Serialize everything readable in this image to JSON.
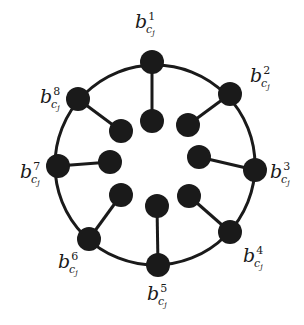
{
  "diagram": {
    "type": "wheel-graph",
    "ring": {
      "cx": 155,
      "cy": 165,
      "r": 100,
      "stroke": "#1a1a1a"
    },
    "node_color": "#1a1a1a",
    "outer_nodes": [
      {
        "id": "b1",
        "base": "b",
        "sup": "1",
        "sub": "cj",
        "x": 152,
        "y": 62,
        "inner": {
          "x": 152,
          "y": 121
        },
        "label": {
          "x": 135,
          "y": 28
        }
      },
      {
        "id": "b2",
        "base": "b",
        "sup": "2",
        "sub": "cj",
        "x": 230,
        "y": 94,
        "inner": {
          "x": 188,
          "y": 125
        },
        "label": {
          "x": 250,
          "y": 82
        }
      },
      {
        "id": "b3",
        "base": "b",
        "sup": "3",
        "sub": "cj",
        "x": 255,
        "y": 170,
        "inner": {
          "x": 199,
          "y": 157
        },
        "label": {
          "x": 270,
          "y": 178
        }
      },
      {
        "id": "b4",
        "base": "b",
        "sup": "4",
        "sub": "cj",
        "x": 230,
        "y": 232,
        "inner": {
          "x": 189,
          "y": 196
        },
        "label": {
          "x": 243,
          "y": 262
        }
      },
      {
        "id": "b5",
        "base": "b",
        "sup": "5",
        "sub": "cj",
        "x": 158,
        "y": 265,
        "inner": {
          "x": 157,
          "y": 206
        },
        "label": {
          "x": 147,
          "y": 300
        }
      },
      {
        "id": "b6",
        "base": "b",
        "sup": "6",
        "sub": "cj",
        "x": 89,
        "y": 239,
        "inner": {
          "x": 121,
          "y": 195
        },
        "label": {
          "x": 58,
          "y": 268
        }
      },
      {
        "id": "b7",
        "base": "b",
        "sup": "7",
        "sub": "cj",
        "x": 58,
        "y": 166,
        "inner": {
          "x": 110,
          "y": 162
        },
        "label": {
          "x": 20,
          "y": 178
        }
      },
      {
        "id": "b8",
        "base": "b",
        "sup": "8",
        "sub": "cj",
        "x": 78,
        "y": 99,
        "inner": {
          "x": 121,
          "y": 131
        },
        "label": {
          "x": 40,
          "y": 103
        }
      }
    ]
  }
}
